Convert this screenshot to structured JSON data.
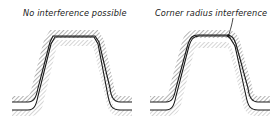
{
  "figure": {
    "panels": [
      {
        "id": "left",
        "label": "No interference possible",
        "description": "Gear tooth profile with chamfered tip corners inside hatched tool outline"
      },
      {
        "id": "right",
        "label": "Corner radius interference",
        "description": "Gear tooth profile with corner radius; leader line points to interference at tip corner"
      }
    ],
    "colors": {
      "line": "#1a1a1a",
      "hatch": "#555555",
      "background": "#ffffff"
    }
  }
}
